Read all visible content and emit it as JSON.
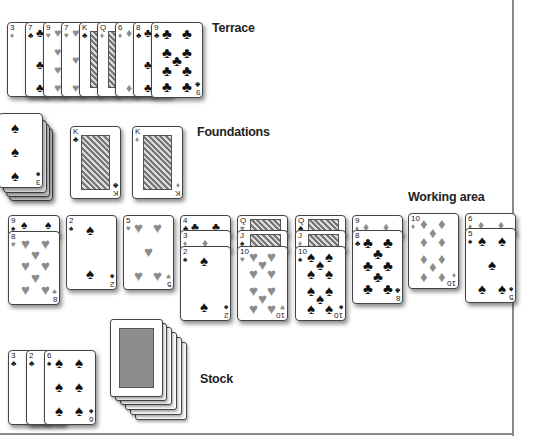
{
  "labels": {
    "terrace": "Terrace",
    "foundations": "Foundations",
    "working_area": "Working area",
    "stock": "Stock"
  },
  "colors": {
    "black_suit": "#111111",
    "red_suit_gray": "#8c8c8c",
    "frame": "#8a8a8a",
    "card_back": "#8d8d8d"
  },
  "terrace": {
    "cards": [
      {
        "rank": "3",
        "suit": "♦"
      },
      {
        "rank": "7",
        "suit": "♣"
      },
      {
        "rank": "9",
        "suit": "♥"
      },
      {
        "rank": "7",
        "suit": "♥"
      },
      {
        "rank": "K",
        "suit": "♣"
      },
      {
        "rank": "Q",
        "suit": "♦"
      },
      {
        "rank": "6",
        "suit": "♦"
      },
      {
        "rank": "8",
        "suit": "♣"
      },
      {
        "rank": "9",
        "suit": "♣"
      }
    ]
  },
  "foundations": {
    "piles": [
      {
        "rank": "3",
        "suit": "♠",
        "note": "stacked pile"
      },
      {
        "rank": "K",
        "suit": "♣"
      },
      {
        "rank": "K",
        "suit": "♦"
      }
    ]
  },
  "working_area": {
    "columns": [
      [
        {
          "rank": "9",
          "suit": "♠"
        },
        {
          "rank": "8",
          "suit": "♥"
        }
      ],
      [
        {
          "rank": "2",
          "suit": "♠"
        }
      ],
      [
        {
          "rank": "5",
          "suit": "♥"
        }
      ],
      [
        {
          "rank": "4",
          "suit": "♣"
        },
        {
          "rank": "3",
          "suit": "♦"
        },
        {
          "rank": "2",
          "suit": "♠"
        }
      ],
      [
        {
          "rank": "Q",
          "suit": "♥"
        },
        {
          "rank": "J",
          "suit": "♠"
        },
        {
          "rank": "10",
          "suit": "♥"
        }
      ],
      [
        {
          "rank": "Q",
          "suit": "♣"
        },
        {
          "rank": "J",
          "suit": "♦"
        },
        {
          "rank": "10",
          "suit": "♠"
        }
      ],
      [
        {
          "rank": "9",
          "suit": "♦"
        },
        {
          "rank": "8",
          "suit": "♣"
        }
      ],
      [
        {
          "rank": "10",
          "suit": "♦"
        }
      ],
      [
        {
          "rank": "6",
          "suit": "♦"
        },
        {
          "rank": "5",
          "suit": "♠"
        }
      ]
    ]
  },
  "stock": {
    "waste": [
      {
        "rank": "3",
        "suit": "♣"
      },
      {
        "rank": "2",
        "suit": "♣"
      },
      {
        "rank": "6",
        "suit": "♠"
      }
    ],
    "face_down_count": 6
  }
}
